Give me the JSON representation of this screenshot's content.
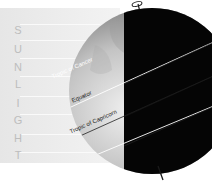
{
  "diagram": {
    "side_label": [
      "S",
      "U",
      "N",
      "L",
      "I",
      "G",
      "H",
      "T"
    ],
    "lines": [
      {
        "name": "tropic-of-cancer",
        "label": "Tropic of Cancer"
      },
      {
        "name": "equator",
        "label": "Equator"
      },
      {
        "name": "tropic-of-capricorn",
        "label": "Tropic of Capricorn"
      }
    ],
    "colors": {
      "night": "#050505",
      "day_light": "#d8d8d8",
      "day_dark": "#5a5a5a",
      "sunlight_band": "#ececec"
    }
  }
}
